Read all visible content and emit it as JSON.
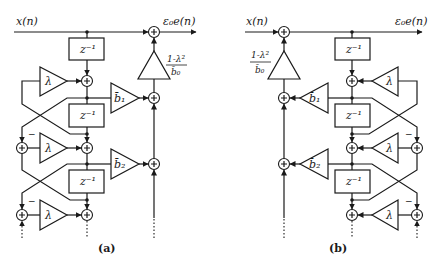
{
  "diagrams": [
    {
      "id": "a",
      "caption": "(a)",
      "input_label": "x(n)",
      "output_label": "ε₀e(n)",
      "delay_label": "z⁻¹",
      "lambda_label": "λ",
      "minus_label": "−",
      "gain_label_num": "1-λ²",
      "gain_label_den": "b̄₀",
      "coef_labels": [
        "b̄₁",
        "b̄₂"
      ]
    },
    {
      "id": "b",
      "caption": "(b)",
      "input_label": "x(n)",
      "output_label": "ε₀e(n)",
      "delay_label": "z⁻¹",
      "lambda_label": "λ",
      "minus_label": "−",
      "gain_label_num": "1-λ²",
      "gain_label_den": "b̄₀",
      "coef_labels": [
        "b̄₁",
        "b̄₂"
      ]
    }
  ],
  "colors": {
    "stroke": "#1a1a1a",
    "background": "#ffffff"
  }
}
